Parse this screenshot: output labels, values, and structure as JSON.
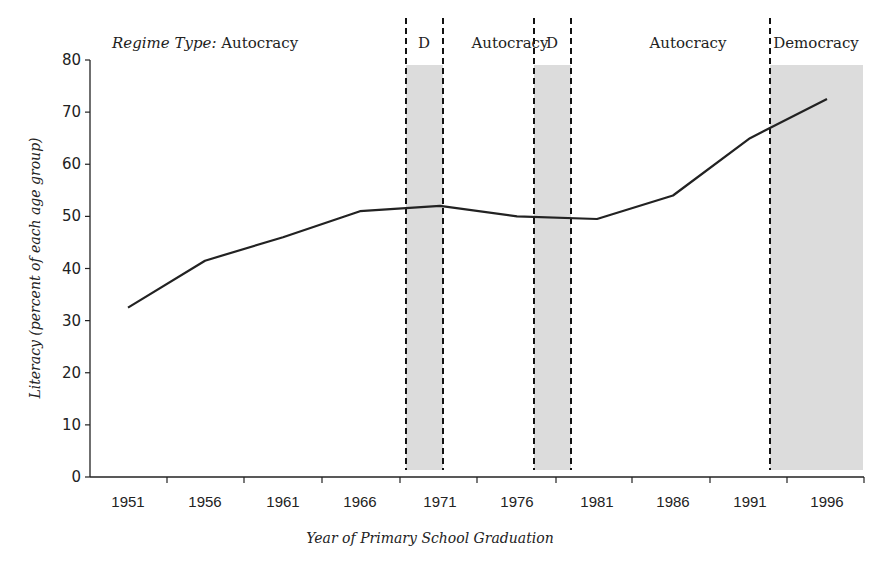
{
  "chart_data": {
    "type": "line",
    "title": "",
    "xlabel": "Year of Primary School Graduation",
    "ylabel": "Literacy (percent of each age group)",
    "ylim": [
      0,
      80
    ],
    "yticks": [
      0,
      10,
      20,
      30,
      40,
      50,
      60,
      70,
      80
    ],
    "categories": [
      "1951",
      "1956",
      "1961",
      "1966",
      "1971",
      "1976",
      "1981",
      "1986",
      "1991",
      "1996"
    ],
    "series": [
      {
        "name": "Literacy",
        "values": [
          32.5,
          41.5,
          46,
          51,
          52,
          50,
          49.5,
          54,
          65,
          72.5
        ]
      }
    ],
    "grid": false,
    "legend": null,
    "annotations": {
      "regime_prefix": "Regime Type:",
      "regimes": [
        {
          "label": "Autocracy",
          "start": "1951",
          "end": "1968",
          "shaded": false
        },
        {
          "label": "D",
          "start": "1968",
          "end": "1971",
          "shaded": true
        },
        {
          "label": "Autocracy",
          "start": "1971",
          "end": "1978",
          "shaded": false
        },
        {
          "label": "D",
          "start": "1978",
          "end": "1981",
          "shaded": true
        },
        {
          "label": "Autocracy",
          "start": "1981",
          "end": "1992",
          "shaded": false
        },
        {
          "label": "Democracy",
          "start": "1992",
          "end": "1998",
          "shaded": true
        }
      ]
    },
    "colors": {
      "line": "#222222",
      "shade": "#dcdcdc",
      "divider": "#111111"
    }
  }
}
